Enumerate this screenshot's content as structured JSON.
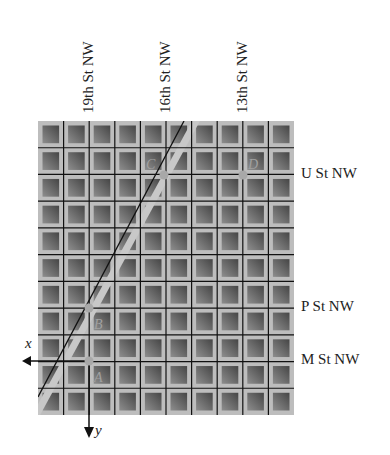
{
  "diagram": {
    "streets_vertical": [
      {
        "label": "19th St NW",
        "x": 89
      },
      {
        "label": "16th St NW",
        "x": 166
      },
      {
        "label": "13th St NW",
        "x": 243
      }
    ],
    "streets_horizontal": [
      {
        "label": "U St NW",
        "y": 175
      },
      {
        "label": "P St NW",
        "y": 308
      },
      {
        "label": "M St NW",
        "y": 361
      }
    ],
    "points": [
      {
        "label": "C",
        "x": 164,
        "y": 175
      },
      {
        "label": "D",
        "x": 243,
        "y": 175
      },
      {
        "label": "B",
        "x": 89,
        "y": 308
      },
      {
        "label": "A",
        "x": 89,
        "y": 361
      }
    ],
    "axes": {
      "x_label": "x",
      "y_label": "y"
    },
    "colors": {
      "road": "#bdbdbd",
      "block_light": "#8a8a8a",
      "block_dark": "#4d4d4d",
      "grid_line": "#111111",
      "point": "#a8a8a8"
    }
  }
}
